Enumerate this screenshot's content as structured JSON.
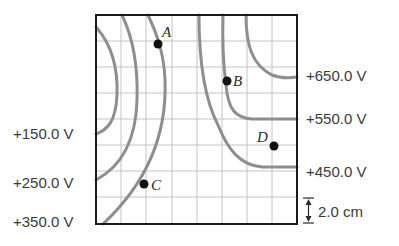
{
  "diagram": {
    "grid": {
      "columns": 8,
      "rows": 8,
      "cell_size_label": "2.0 cm"
    },
    "colors": {
      "frame": "#1a1a1a",
      "grid": "#bdbdbd",
      "curve": "#8a8a8a",
      "point": "#111111",
      "text": "#3a3a3a"
    },
    "left_labels": [
      {
        "text": "+150.0 V"
      },
      {
        "text": "+250.0 V"
      },
      {
        "text": "+350.0 V"
      }
    ],
    "right_labels": [
      {
        "text": "+650.0 V"
      },
      {
        "text": "+550.0 V"
      },
      {
        "text": "+450.0 V"
      }
    ],
    "points": [
      {
        "name": "A"
      },
      {
        "name": "B"
      },
      {
        "name": "C"
      },
      {
        "name": "D"
      }
    ],
    "scale": {
      "label": "2.0 cm",
      "icon": "double-arrow-icon"
    }
  }
}
